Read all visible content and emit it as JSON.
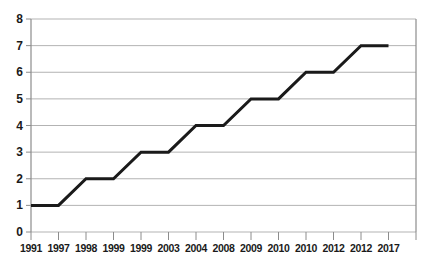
{
  "chart_data": {
    "type": "line",
    "title": "",
    "subtitle": "",
    "xlabel": "",
    "ylabel": "",
    "ylim": [
      0,
      8
    ],
    "y_ticks": [
      0,
      1,
      2,
      3,
      4,
      5,
      6,
      7,
      8
    ],
    "grid": true,
    "legend": null,
    "legend_position": "none",
    "line_color": "#1a1a1a",
    "grid_color": "#b3b3b3",
    "categories": [
      "1991",
      "1997",
      "1998",
      "1999",
      "1999",
      "2003",
      "2004",
      "2008",
      "2009",
      "2010",
      "2010",
      "2012",
      "2012",
      "2017"
    ],
    "values": [
      1,
      1,
      2,
      2,
      3,
      3,
      4,
      4,
      5,
      5,
      6,
      6,
      7,
      7
    ],
    "series": [
      {
        "name": "",
        "values": [
          1,
          1,
          2,
          2,
          3,
          3,
          4,
          4,
          5,
          5,
          6,
          6,
          7,
          7
        ]
      }
    ],
    "points": [
      {
        "x": "1991",
        "y": 1
      },
      {
        "x": "1997",
        "y": 1
      },
      {
        "x": "1998",
        "y": 2
      },
      {
        "x": "1999",
        "y": 2
      },
      {
        "x": "1999",
        "y": 3
      },
      {
        "x": "2003",
        "y": 3
      },
      {
        "x": "2004",
        "y": 4
      },
      {
        "x": "2008",
        "y": 4
      },
      {
        "x": "2009",
        "y": 5
      },
      {
        "x": "2010",
        "y": 5
      },
      {
        "x": "2010",
        "y": 6
      },
      {
        "x": "2012",
        "y": 6
      },
      {
        "x": "2012",
        "y": 7
      },
      {
        "x": "2017",
        "y": 7
      }
    ]
  },
  "axis": {
    "y_labels": [
      "8",
      "7",
      "6",
      "5",
      "4",
      "3",
      "2",
      "1",
      "0"
    ],
    "x_labels": [
      "1991",
      "1997",
      "1998",
      "1999",
      "1999",
      "2003",
      "2004",
      "2008",
      "2009",
      "2010",
      "2010",
      "2012",
      "2012",
      "2017"
    ]
  }
}
